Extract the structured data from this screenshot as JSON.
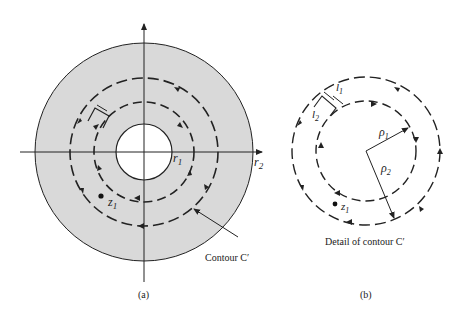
{
  "figure_a": {
    "caption": "(a)",
    "labels": {
      "r1": "r",
      "r1_sub": "1",
      "r2": "r",
      "r2_sub": "2",
      "z1": "z",
      "z1_sub": "1",
      "contour": "Contour C′"
    },
    "colors": {
      "annulus_fill": "#d9d9d9",
      "stroke": "#222222"
    }
  },
  "figure_b": {
    "caption": "(b)",
    "title": "Detail of contour C′",
    "labels": {
      "l1": "l",
      "l1_sub": "1",
      "l2": "l",
      "l2_sub": "2",
      "rho1": "ρ",
      "rho1_sub": "1",
      "rho2": "ρ",
      "rho2_sub": "2",
      "z1": "z",
      "z1_sub": "1"
    }
  }
}
